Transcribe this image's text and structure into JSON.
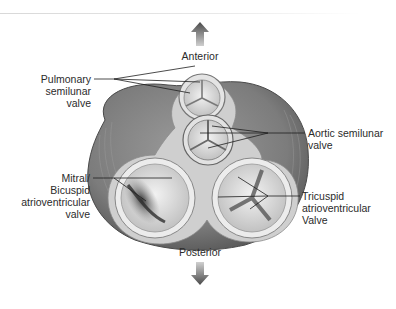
{
  "diagram": {
    "orientation": {
      "top": "Anterior",
      "bottom": "Posterior"
    },
    "labels": {
      "pulmonary": [
        "Pulmonary",
        "semilunar",
        "valve"
      ],
      "aortic": [
        "Aortic semilunar",
        "valve"
      ],
      "mitral": [
        "Mitral/",
        "Bicuspid",
        "atrioventricular",
        "valve"
      ],
      "tricuspid": [
        "Tricuspid",
        "atrioventricular",
        "Valve"
      ]
    },
    "icons": {
      "up": "arrow-up-icon",
      "down": "arrow-down-icon"
    },
    "colors": {
      "muscle": "#7a7a7a",
      "muscle_dark": "#4f4f4f",
      "annulus": "#e6e6e6",
      "leaflet": "#d4d4d4",
      "arrow": "#5a5a5a",
      "leader_line": "#1e1e1e"
    }
  }
}
